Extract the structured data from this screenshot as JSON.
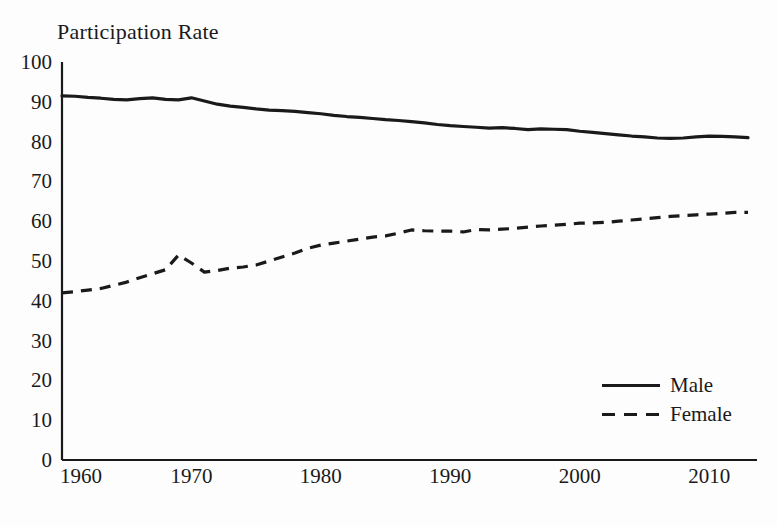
{
  "figure": {
    "title": "Participation Rate",
    "background_color": "#fdfdfd",
    "ink_color": "#1a1a1a"
  },
  "legend": {
    "position": "bottom-right",
    "items": [
      {
        "label": "Male",
        "style": "solid",
        "color": "#1a1a1a"
      },
      {
        "label": "Female",
        "style": "dashed",
        "color": "#1a1a1a"
      }
    ]
  },
  "axes": {
    "y_ticks": [
      "100",
      "90",
      "80",
      "70",
      "60",
      "50",
      "40",
      "30",
      "20",
      "10",
      "0"
    ],
    "x_ticks": [
      "1960",
      "1970",
      "1980",
      "1990",
      "2000",
      "2010"
    ]
  },
  "chart_data": {
    "type": "line",
    "title": "Participation Rate",
    "xlabel": "",
    "ylabel": "Participation Rate",
    "xlim": [
      1960,
      2013
    ],
    "ylim": [
      0,
      100
    ],
    "ytick_step": 10,
    "xtick_step": 10,
    "grid": false,
    "legend_position": "bottom-right",
    "x": [
      1960,
      1961,
      1962,
      1963,
      1964,
      1965,
      1966,
      1967,
      1968,
      1969,
      1970,
      1971,
      1972,
      1973,
      1974,
      1975,
      1976,
      1977,
      1978,
      1979,
      1980,
      1981,
      1982,
      1983,
      1984,
      1985,
      1986,
      1987,
      1988,
      1989,
      1990,
      1991,
      1992,
      1993,
      1994,
      1995,
      1996,
      1997,
      1998,
      1999,
      2000,
      2001,
      2002,
      2003,
      2004,
      2005,
      2006,
      2007,
      2008,
      2009,
      2010,
      2011,
      2012,
      2013
    ],
    "series": [
      {
        "name": "Male",
        "style": "solid",
        "color": "#1a1a1a",
        "values": [
          91.5,
          91.4,
          91.1,
          90.9,
          90.6,
          90.5,
          90.8,
          91.0,
          90.6,
          90.5,
          91.0,
          90.2,
          89.4,
          88.9,
          88.6,
          88.2,
          87.9,
          87.8,
          87.6,
          87.3,
          87.0,
          86.6,
          86.3,
          86.1,
          85.8,
          85.5,
          85.3,
          85.0,
          84.7,
          84.3,
          84.0,
          83.8,
          83.6,
          83.4,
          83.5,
          83.3,
          83.0,
          83.2,
          83.1,
          83.0,
          82.6,
          82.3,
          82.0,
          81.7,
          81.4,
          81.2,
          80.9,
          80.8,
          80.9,
          81.2,
          81.4,
          81.3,
          81.2,
          81.0
        ]
      },
      {
        "name": "Female",
        "style": "dashed",
        "color": "#1a1a1a",
        "values": [
          42.0,
          42.3,
          42.7,
          43.1,
          43.9,
          44.7,
          45.8,
          46.8,
          47.8,
          51.5,
          49.5,
          47.2,
          47.6,
          48.2,
          48.5,
          49.0,
          50.0,
          51.0,
          52.0,
          53.2,
          54.0,
          54.5,
          55.0,
          55.5,
          56.0,
          56.3,
          57.0,
          57.8,
          57.6,
          57.5,
          57.5,
          57.3,
          57.9,
          57.8,
          58.0,
          58.2,
          58.5,
          58.8,
          59.0,
          59.2,
          59.5,
          59.6,
          59.7,
          60.0,
          60.3,
          60.6,
          60.9,
          61.2,
          61.4,
          61.6,
          61.8,
          62.0,
          62.2,
          62.2
        ]
      }
    ]
  }
}
